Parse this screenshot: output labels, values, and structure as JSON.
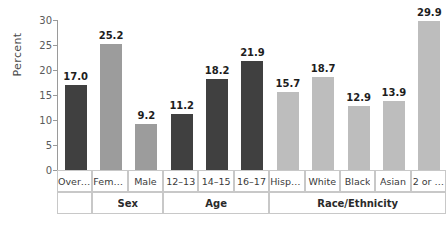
{
  "chart_data": {
    "type": "bar",
    "title": "",
    "xlabel": "",
    "ylabel": "Percent",
    "ylim": [
      0,
      30
    ],
    "ytick_values": [
      0,
      5,
      10,
      15,
      20,
      25,
      30
    ],
    "yticks": [
      "0",
      "5",
      "10",
      "15",
      "20",
      "25",
      "30"
    ],
    "grid": false,
    "legend": "none",
    "categories": [
      "Overall",
      "Female",
      "Male",
      "12–13",
      "14–15",
      "16–17",
      "Hispa…",
      "White",
      "Black",
      "Asian",
      "2 or …"
    ],
    "values": [
      17.0,
      25.2,
      9.2,
      11.2,
      18.2,
      21.9,
      15.7,
      18.7,
      12.9,
      13.9,
      29.9
    ],
    "value_labels": [
      "17.0",
      "25.2",
      "9.2",
      "11.2",
      "18.2",
      "21.9",
      "15.7",
      "18.7",
      "12.9",
      "13.9",
      "29.9"
    ],
    "bar_colors": [
      "#404040",
      "#9c9c9c",
      "#9c9c9c",
      "#404040",
      "#404040",
      "#404040",
      "#bdbdbd",
      "#bdbdbd",
      "#bdbdbd",
      "#bdbdbd",
      "#bdbdbd"
    ],
    "groups": [
      {
        "label": "",
        "span": 1
      },
      {
        "label": "Sex",
        "span": 2
      },
      {
        "label": "Age",
        "span": 3
      },
      {
        "label": "Race/Ethnicity",
        "span": 5
      }
    ]
  },
  "colors": {
    "dark_bar": "#404040",
    "medium_bar": "#9c9c9c",
    "light_bar": "#bdbdbd",
    "axis": "#9a9a9a",
    "grid_border": "#c8c8c8",
    "text": "#333333",
    "background": "#ffffff"
  }
}
